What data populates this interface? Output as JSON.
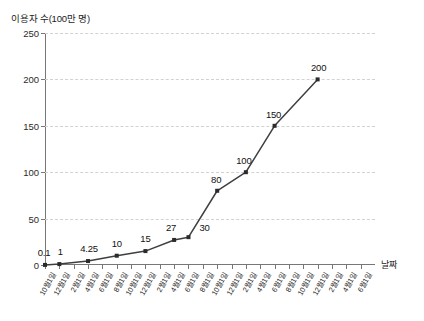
{
  "chart_data": {
    "type": "line",
    "title": "",
    "ylabel": "이용자 수(100만 명)",
    "xlabel": "날짜",
    "ylim": [
      0,
      250
    ],
    "yticks": [
      0,
      50,
      100,
      150,
      200,
      250
    ],
    "grid": true,
    "legend": false,
    "categories": [
      "10월1일",
      "12월1일",
      "2월1일",
      "4월1일",
      "6월1일",
      "8월1일",
      "10월1일",
      "12월1일",
      "2월1일",
      "4월1일",
      "6월1일",
      "8월1일",
      "10월1일",
      "12월1일",
      "2월1일",
      "4월1일",
      "6월1일",
      "8월1일",
      "10월1일",
      "12월1일",
      "2월1일",
      "4월1일",
      "6월1일"
    ],
    "points": [
      {
        "category": "10월1일",
        "index": 0,
        "value": 0.1,
        "label": "0.1"
      },
      {
        "category": "12월1일",
        "index": 1,
        "value": 1,
        "label": "1"
      },
      {
        "category": "4월1일",
        "index": 3,
        "value": 4.25,
        "label": "4.25"
      },
      {
        "category": "8월1일",
        "index": 5,
        "value": 10,
        "label": "10"
      },
      {
        "category": "12월1일",
        "index": 7,
        "value": 15,
        "label": "15"
      },
      {
        "category": "4월1일",
        "index": 9,
        "value": 27,
        "label": "27"
      },
      {
        "category": "6월1일",
        "index": 10,
        "value": 30,
        "label": "30"
      },
      {
        "category": "10월1일",
        "index": 12,
        "value": 80,
        "label": "80"
      },
      {
        "category": "2월1일",
        "index": 14,
        "value": 100,
        "label": "100"
      },
      {
        "category": "6월1일",
        "index": 16,
        "value": 150,
        "label": "150"
      },
      {
        "category": "12월1일",
        "index": 19,
        "value": 200,
        "label": "200"
      }
    ],
    "colors": {
      "line": "#3f3f3f",
      "marker": "#2b2b2b",
      "grid": "#d2d2d2",
      "axis": "#777777",
      "text": "#1b1b1b"
    }
  }
}
